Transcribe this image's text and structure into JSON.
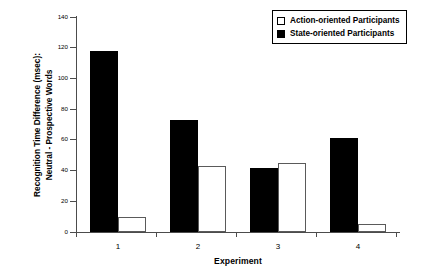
{
  "chart_data": {
    "type": "bar",
    "title": "",
    "xlabel": "Experiment",
    "ylabel": "Recognition Time Difference (msec): Neutral - Prospective Words",
    "ylabel_line1": "Recognition Time Difference (msec):",
    "ylabel_line2": "Neutral - Prospective Words",
    "categories": [
      "1",
      "2",
      "3",
      "4"
    ],
    "series": [
      {
        "name": "Action-oriented Participants",
        "color": "#ffffff",
        "edge_color": "#5a5a5a",
        "swatch": "open-square",
        "values": [
          10,
          43,
          45,
          5
        ]
      },
      {
        "name": "State-oriented Participants",
        "color": "#000000",
        "edge_color": "#000000",
        "swatch": "filled-square",
        "values": [
          118,
          73,
          42,
          61
        ]
      }
    ],
    "ylim": [
      0,
      140
    ],
    "yticks": [
      0,
      20,
      40,
      60,
      80,
      100,
      120,
      140
    ],
    "ytick_labels": [
      "0",
      "20",
      "40",
      "60",
      "80",
      "100",
      "120",
      "140"
    ],
    "grid": false,
    "legend_position": "top-right"
  },
  "legend": {
    "entries": [
      {
        "label": "Action-oriented Participants",
        "swatch": "open-square"
      },
      {
        "label": "State-oriented Participants",
        "swatch": "filled-square"
      }
    ]
  }
}
